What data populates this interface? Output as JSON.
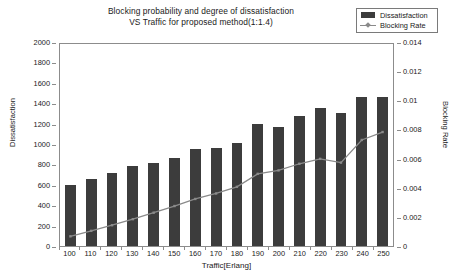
{
  "chart_data": {
    "type": "bar",
    "title": "Blocking probability and degree of dissatisfaction VS Traffic for proposed method(1:1.4)",
    "title_line1": "Blocking probability and degree of dissatisfaction",
    "title_line2": "VS Traffic for proposed method(1:1.4)",
    "xlabel": "Traffic[Erlang]",
    "ylabel": "Dissatisfaction",
    "y2label": "Blocking Rate",
    "categories": [
      100,
      110,
      120,
      130,
      140,
      150,
      160,
      170,
      180,
      190,
      200,
      210,
      220,
      230,
      240,
      250
    ],
    "category_labels": [
      "100",
      "110",
      "120",
      "130",
      "140",
      "150",
      "160",
      "170",
      "180",
      "190",
      "200",
      "210",
      "220",
      "230",
      "240",
      "250"
    ],
    "ylim": [
      0,
      2000
    ],
    "y2lim": [
      0,
      0.014
    ],
    "ytick_labels": [
      "2000",
      "1800",
      "1600",
      "1400",
      "1200",
      "1000",
      "800",
      "600",
      "400",
      "200",
      "0"
    ],
    "ytick_values": [
      2000,
      1800,
      1600,
      1400,
      1200,
      1000,
      800,
      600,
      400,
      200,
      0
    ],
    "y2tick_labels": [
      "0.014",
      "0.012",
      "0.01",
      "0.008",
      "0.006",
      "0.004",
      "0.002",
      "0"
    ],
    "y2tick_values": [
      0.014,
      0.012,
      0.01,
      0.008,
      0.006,
      0.004,
      0.002,
      0
    ],
    "grid": false,
    "legend_position": "top-right",
    "series": [
      {
        "name": "Dissatisfaction",
        "type": "bar",
        "axis": "left",
        "color": "#3c3c3c",
        "values": [
          600,
          660,
          715,
          780,
          815,
          865,
          950,
          965,
          1010,
          1200,
          1165,
          1270,
          1350,
          1305,
          1460,
          1465
        ]
      },
      {
        "name": "Blocking Rate",
        "type": "line",
        "axis": "right",
        "color": "#8a8a8a",
        "values": [
          0.00067,
          0.00105,
          0.00144,
          0.00186,
          0.00231,
          0.00277,
          0.00326,
          0.00364,
          0.0041,
          0.005,
          0.00524,
          0.0057,
          0.00604,
          0.00578,
          0.00735,
          0.0079
        ]
      }
    ]
  },
  "legend": {
    "items": [
      {
        "label": "Dissatisfaction",
        "marker": "filled-rect",
        "color": "#3c3c3c"
      },
      {
        "label": "Blocking Rate",
        "marker": "line-with-point",
        "color": "#8a8a8a"
      }
    ]
  }
}
